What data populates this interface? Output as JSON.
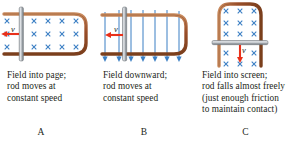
{
  "figure": {
    "colors": {
      "rail": "#a0522d",
      "rail_dark": "#7b3f1d",
      "rod": "#9aa0a6",
      "rod_light": "#c9ced3",
      "field": "#3b7fc4",
      "velocity_arrow": "#e8301a",
      "text": "#231f20",
      "background": "#ffffff"
    }
  },
  "panels": [
    {
      "id": "A",
      "label": "A",
      "velocity_symbol": "v",
      "field_symbol": "×",
      "field_direction": "into-page",
      "rod_orientation": "vertical",
      "rail_orientation": "horizontal",
      "velocity_direction": "left",
      "field_marks_rows": 3,
      "field_marks_cols": 5,
      "caption": [
        "Field into page;",
        "rod moves at",
        "constant speed"
      ]
    },
    {
      "id": "B",
      "label": "B",
      "velocity_symbol": "v",
      "field_symbol": "arrow-down",
      "field_direction": "downward",
      "rod_orientation": "vertical",
      "rail_orientation": "horizontal",
      "velocity_direction": "left",
      "field_line_count": 7,
      "caption": [
        "Field downward;",
        "rod moves at",
        "constant speed"
      ]
    },
    {
      "id": "C",
      "label": "C",
      "velocity_symbol": "v",
      "field_symbol": "×",
      "field_direction": "into-screen",
      "rod_orientation": "horizontal",
      "rail_orientation": "vertical",
      "velocity_direction": "down",
      "field_marks_rows": 5,
      "field_marks_cols": 3,
      "caption": [
        "Field into screen;",
        "rod falls almost freely",
        "(just enough friction",
        "to maintain contact)"
      ]
    }
  ]
}
